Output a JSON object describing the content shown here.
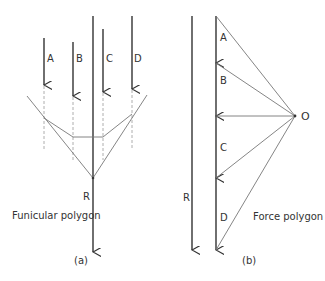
{
  "figure_a": {
    "forces": [
      {
        "label": "A"
      },
      {
        "label": "B"
      },
      {
        "label": "C"
      },
      {
        "label": "D"
      }
    ],
    "resultant_label": "R",
    "title": "Funicular polygon",
    "caption": "(a)"
  },
  "figure_b": {
    "segments": [
      {
        "label": "A"
      },
      {
        "label": "B"
      },
      {
        "label": "C"
      },
      {
        "label": "D"
      }
    ],
    "resultant_label": "R",
    "pole_label": "O",
    "title": "Force polygon",
    "caption": "(b)"
  },
  "colors": {
    "heavy_line": "#333333",
    "thin_line": "#777777",
    "dashed_line": "#999999"
  }
}
